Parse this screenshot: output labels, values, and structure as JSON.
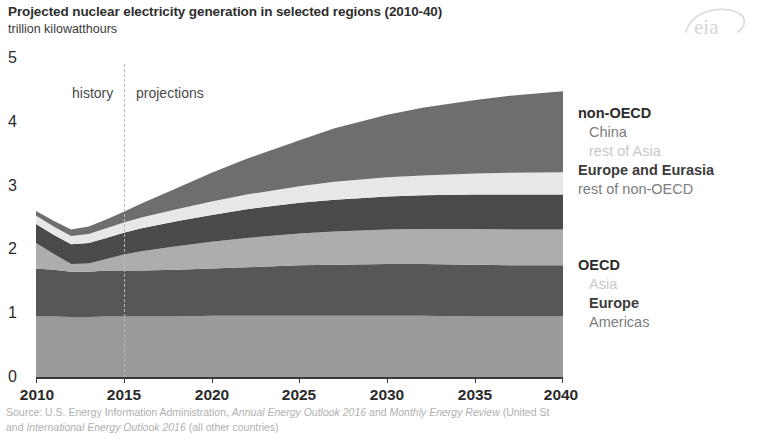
{
  "header": {
    "title": "Projected nuclear electricity generation in selected regions (2010-40)",
    "subtitle": "trillion kilowatthours",
    "logo_name": "eia"
  },
  "annotations": {
    "history": "history",
    "projections": "projections",
    "divider_year": 2015
  },
  "legend": {
    "nonoecd": {
      "group": "non-OECD",
      "items": [
        {
          "label": "China",
          "color": "#6e6e6e",
          "text_style": "mid"
        },
        {
          "label": "rest of Asia",
          "color": "#e8e8e8",
          "text_style": "light"
        },
        {
          "label": "Europe and Eurasia",
          "color": "#4a4a4a",
          "text_style": "dark"
        },
        {
          "label": "rest of non-OECD",
          "color": "#adadad",
          "text_style": "mid"
        }
      ]
    },
    "oecd": {
      "group": "OECD",
      "items": [
        {
          "label": "Asia",
          "color": "#adadad",
          "text_style": "light"
        },
        {
          "label": "Europe",
          "color": "#575757",
          "text_style": "dark"
        },
        {
          "label": "Americas",
          "color": "#9a9a9a",
          "text_style": "mid"
        }
      ]
    }
  },
  "source": {
    "line1_plain_a": "Source: U.S. Energy Information Administration, ",
    "line1_ital_a": "Annual Energy Outlook 2016",
    "line1_plain_b": " and ",
    "line1_ital_b": "Monthly Energy Review",
    "line1_plain_c": " (United St",
    "line2_plain_a": "and ",
    "line2_ital_a": "International Energy Outlook 2016",
    "line2_plain_b": " (all other countries)"
  },
  "chart_data": {
    "type": "area",
    "title": "Projected nuclear electricity generation in selected regions (2010-40)",
    "subtitle": "trillion kilowatthours",
    "xlabel": "",
    "ylabel": "trillion kilowatthours",
    "xlim": [
      2010,
      2040
    ],
    "ylim": [
      0,
      5
    ],
    "yticks": [
      0,
      1,
      2,
      3,
      4,
      5
    ],
    "xticks": [
      2010,
      2015,
      2020,
      2025,
      2030,
      2035,
      2040
    ],
    "grid": false,
    "stacked": true,
    "legend_position": "right",
    "history_projection_split": 2015,
    "x": [
      2010,
      2011,
      2012,
      2013,
      2014,
      2015,
      2016,
      2018,
      2020,
      2022,
      2025,
      2027,
      2030,
      2032,
      2035,
      2037,
      2040
    ],
    "series": [
      {
        "name": "OECD Americas",
        "color": "#9a9a9a",
        "values": [
          0.95,
          0.95,
          0.94,
          0.94,
          0.95,
          0.95,
          0.95,
          0.95,
          0.96,
          0.96,
          0.96,
          0.96,
          0.96,
          0.96,
          0.95,
          0.95,
          0.95
        ]
      },
      {
        "name": "OECD Europe",
        "color": "#575757",
        "values": [
          0.75,
          0.73,
          0.71,
          0.71,
          0.72,
          0.72,
          0.72,
          0.73,
          0.74,
          0.76,
          0.79,
          0.8,
          0.81,
          0.81,
          0.81,
          0.8,
          0.8
        ]
      },
      {
        "name": "OECD Asia",
        "color": "#adadad",
        "values": [
          0.4,
          0.25,
          0.12,
          0.13,
          0.18,
          0.25,
          0.3,
          0.37,
          0.42,
          0.46,
          0.5,
          0.52,
          0.54,
          0.55,
          0.56,
          0.56,
          0.56
        ]
      },
      {
        "name": "rest of non-OECD",
        "color": "#4a4a4a",
        "values": [
          0.3,
          0.3,
          0.31,
          0.32,
          0.33,
          0.34,
          0.36,
          0.39,
          0.42,
          0.45,
          0.48,
          0.5,
          0.52,
          0.53,
          0.54,
          0.55,
          0.55
        ]
      },
      {
        "name": "Europe and Eurasia",
        "color": "#e8e8e8",
        "values": [
          0.13,
          0.13,
          0.13,
          0.14,
          0.15,
          0.16,
          0.17,
          0.19,
          0.21,
          0.23,
          0.26,
          0.28,
          0.3,
          0.31,
          0.33,
          0.34,
          0.35
        ]
      },
      {
        "name": "China",
        "color": "#6e6e6e",
        "values": [
          0.07,
          0.09,
          0.1,
          0.12,
          0.14,
          0.17,
          0.22,
          0.33,
          0.45,
          0.56,
          0.72,
          0.84,
          0.98,
          1.06,
          1.15,
          1.21,
          1.27
        ]
      }
    ],
    "totals": [
      2.6,
      2.45,
      2.31,
      2.36,
      2.47,
      2.59,
      2.72,
      2.96,
      3.2,
      3.42,
      3.71,
      3.9,
      4.11,
      4.22,
      4.34,
      4.41,
      4.48
    ]
  }
}
